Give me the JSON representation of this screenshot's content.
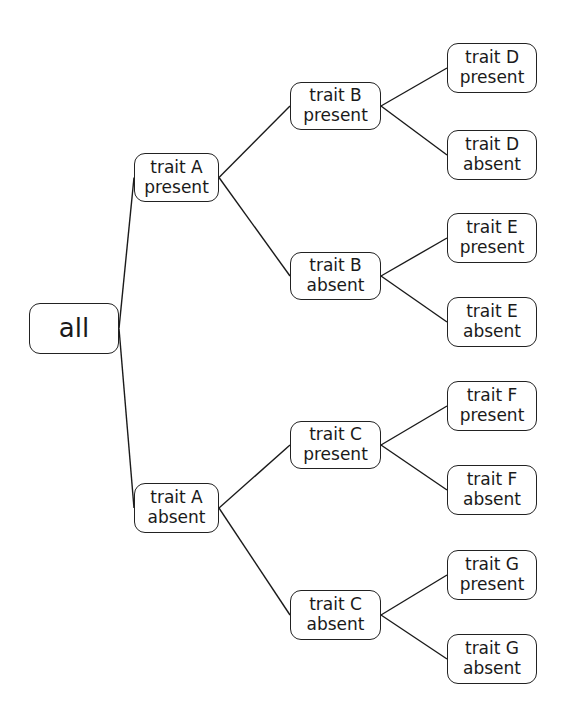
{
  "diagram": {
    "type": "decision-tree",
    "orientation": "left-to-right",
    "colors": {
      "background": "#ffffff",
      "stroke": "#222222",
      "text": "#1a1a1a"
    },
    "root": {
      "id": "all",
      "label": "all",
      "box": {
        "x": 29,
        "y": 303,
        "w": 90,
        "h": 51
      }
    },
    "nodes": [
      {
        "id": "A_present",
        "line1": "trait A",
        "line2": "present",
        "parent": "all",
        "box": {
          "x": 134,
          "y": 153,
          "w": 85,
          "h": 49
        }
      },
      {
        "id": "A_absent",
        "line1": "trait A",
        "line2": "absent",
        "parent": "all",
        "box": {
          "x": 134,
          "y": 483,
          "w": 85,
          "h": 50
        }
      },
      {
        "id": "B_present",
        "line1": "trait B",
        "line2": "present",
        "parent": "A_present",
        "box": {
          "x": 290,
          "y": 82,
          "w": 91,
          "h": 48
        }
      },
      {
        "id": "B_absent",
        "line1": "trait B",
        "line2": "absent",
        "parent": "A_present",
        "box": {
          "x": 290,
          "y": 252,
          "w": 91,
          "h": 48
        }
      },
      {
        "id": "C_present",
        "line1": "trait C",
        "line2": "present",
        "parent": "A_absent",
        "box": {
          "x": 290,
          "y": 421,
          "w": 91,
          "h": 48
        }
      },
      {
        "id": "C_absent",
        "line1": "trait C",
        "line2": "absent",
        "parent": "A_absent",
        "box": {
          "x": 290,
          "y": 590,
          "w": 91,
          "h": 50
        }
      },
      {
        "id": "D_present",
        "line1": "trait D",
        "line2": "present",
        "parent": "B_present",
        "box": {
          "x": 447,
          "y": 43,
          "w": 90,
          "h": 50
        }
      },
      {
        "id": "D_absent",
        "line1": "trait D",
        "line2": "absent",
        "parent": "B_present",
        "box": {
          "x": 447,
          "y": 130,
          "w": 90,
          "h": 50
        }
      },
      {
        "id": "E_present",
        "line1": "trait E",
        "line2": "present",
        "parent": "B_absent",
        "box": {
          "x": 447,
          "y": 213,
          "w": 90,
          "h": 50
        }
      },
      {
        "id": "E_absent",
        "line1": "trait E",
        "line2": "absent",
        "parent": "B_absent",
        "box": {
          "x": 447,
          "y": 297,
          "w": 90,
          "h": 50
        }
      },
      {
        "id": "F_present",
        "line1": "trait F",
        "line2": "present",
        "parent": "C_present",
        "box": {
          "x": 447,
          "y": 381,
          "w": 90,
          "h": 50
        }
      },
      {
        "id": "F_absent",
        "line1": "trait F",
        "line2": "absent",
        "parent": "C_present",
        "box": {
          "x": 447,
          "y": 465,
          "w": 90,
          "h": 50
        }
      },
      {
        "id": "G_present",
        "line1": "trait G",
        "line2": "present",
        "parent": "C_absent",
        "box": {
          "x": 447,
          "y": 550,
          "w": 90,
          "h": 50
        }
      },
      {
        "id": "G_absent",
        "line1": "trait G",
        "line2": "absent",
        "parent": "C_absent",
        "box": {
          "x": 447,
          "y": 634,
          "w": 90,
          "h": 50
        }
      }
    ]
  }
}
